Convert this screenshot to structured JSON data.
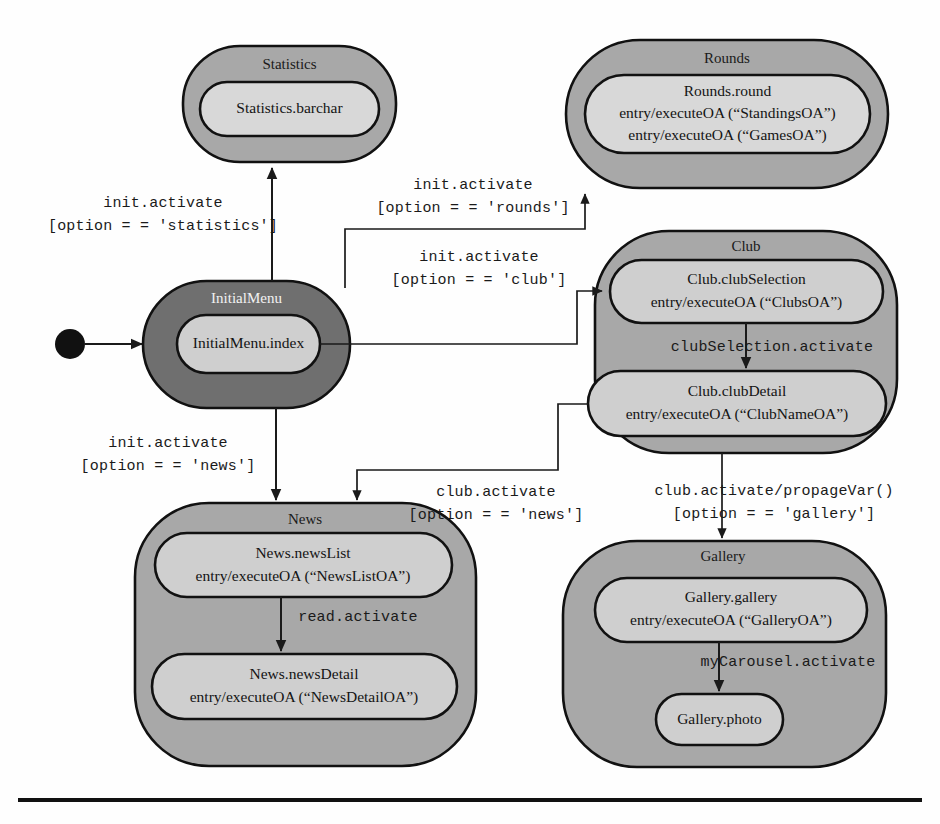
{
  "diagram": {
    "colors": {
      "outer_default": "#a8a8a8",
      "outer_highlight": "#6f6f6f",
      "inner_default": "#cfcfcf",
      "inner_light": "#d8d8d8",
      "stroke": "#111111",
      "title_text": "#1a1a1a",
      "title_text_inverted": "#f2f2f2",
      "background": "#fefefe"
    },
    "initial_pseudostate": {
      "name": "initial-state-dot",
      "label": ""
    },
    "states": [
      {
        "id": "statistics",
        "title": "Statistics",
        "highlight": false,
        "substates": [
          {
            "id": "statistics-barchar",
            "lines": [
              "Statistics.barchar"
            ]
          }
        ]
      },
      {
        "id": "rounds",
        "title": "Rounds",
        "highlight": false,
        "substates": [
          {
            "id": "rounds-round",
            "lines": [
              "Rounds.round",
              "entry/executeOA (“StandingsOA”)",
              "entry/executeOA (“GamesOA”)"
            ]
          }
        ]
      },
      {
        "id": "initialmenu",
        "title": "InitialMenu",
        "highlight": true,
        "substates": [
          {
            "id": "initialmenu-index",
            "lines": [
              "InitialMenu.index"
            ]
          }
        ]
      },
      {
        "id": "club",
        "title": "Club",
        "highlight": false,
        "substates": [
          {
            "id": "club-clubselection",
            "lines": [
              "Club.clubSelection",
              "entry/executeOA (“ClubsOA”)"
            ]
          },
          {
            "id": "club-clubdetail",
            "lines": [
              "Club.clubDetail",
              "entry/executeOA (“ClubNameOA”)"
            ]
          }
        ]
      },
      {
        "id": "news",
        "title": "News",
        "highlight": false,
        "substates": [
          {
            "id": "news-newslist",
            "lines": [
              "News.newsList",
              "entry/executeOA (“NewsListOA”)"
            ]
          },
          {
            "id": "news-newsdetail",
            "lines": [
              "News.newsDetail",
              "entry/executeOA (“NewsDetailOA”)"
            ]
          }
        ]
      },
      {
        "id": "gallery",
        "title": "Gallery",
        "highlight": false,
        "substates": [
          {
            "id": "gallery-gallery",
            "lines": [
              "Gallery.gallery",
              "entry/executeOA (“GalleryOA”)"
            ]
          },
          {
            "id": "gallery-photo",
            "lines": [
              "Gallery.photo"
            ]
          }
        ]
      }
    ],
    "transitions": [
      {
        "id": "to-statistics",
        "from": "initialmenu",
        "to": "statistics",
        "lines": [
          "init.activate",
          "[option = = 'statistics']"
        ]
      },
      {
        "id": "to-rounds",
        "from": "initialmenu",
        "to": "rounds",
        "lines": [
          "init.activate",
          "[option = = 'rounds']"
        ]
      },
      {
        "id": "to-club",
        "from": "initialmenu",
        "to": "club",
        "lines": [
          "init.activate",
          "[option = = 'club']"
        ]
      },
      {
        "id": "to-news",
        "from": "initialmenu",
        "to": "news",
        "lines": [
          "init.activate",
          "[option = = 'news']"
        ]
      },
      {
        "id": "clubselection-to-clubdetail",
        "from": "club-clubselection",
        "to": "club-clubdetail",
        "lines": [
          "clubSelection.activate"
        ]
      },
      {
        "id": "newslist-to-newsdetail",
        "from": "news-newslist",
        "to": "news-newsdetail",
        "lines": [
          "read.activate"
        ]
      },
      {
        "id": "gallery-to-photo",
        "from": "gallery-gallery",
        "to": "gallery-photo",
        "lines": [
          "myCarousel.activate"
        ]
      },
      {
        "id": "clubdetail-to-news",
        "from": "club-clubdetail",
        "to": "news",
        "lines": [
          "club.activate",
          "[option = = 'news']"
        ]
      },
      {
        "id": "clubdetail-to-gallery",
        "from": "club-clubdetail",
        "to": "gallery",
        "lines": [
          "club.activate/propageVar()",
          "[option = = 'gallery']"
        ]
      }
    ]
  }
}
